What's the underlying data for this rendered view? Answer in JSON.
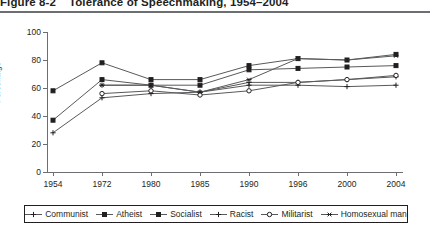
{
  "figure": {
    "number": "Figure 8-2",
    "caption": "Tolerance of Speechmaking, 1954–2004"
  },
  "chart_data": {
    "type": "line",
    "title": "Tolerance of Speechmaking, 1954–2004",
    "xlabel": "",
    "ylabel": "Percentage",
    "ylim": [
      0,
      100
    ],
    "ytick_labels": [
      "0",
      "20",
      "40",
      "60",
      "80",
      "100"
    ],
    "yticks": [
      0,
      20,
      40,
      60,
      80,
      100
    ],
    "grid": false,
    "legend_position": "bottom",
    "categories": [
      "1954",
      "1972",
      "1980",
      "1985",
      "1990",
      "1996",
      "2000",
      "2004"
    ],
    "x": [
      1954,
      1972,
      1980,
      1985,
      1990,
      1996,
      2000,
      2004
    ],
    "series": [
      {
        "name": "Communist",
        "marker": "cross",
        "values": [
          28,
          53,
          56,
          57,
          64,
          64,
          66,
          68
        ]
      },
      {
        "name": "Atheist",
        "marker": "square",
        "values": [
          37,
          66,
          62,
          62,
          73,
          74,
          75,
          76
        ]
      },
      {
        "name": "Socialist",
        "marker": "square",
        "values": [
          58,
          78,
          66,
          66,
          76,
          81,
          80,
          84
        ]
      },
      {
        "name": "Racist",
        "marker": "cross",
        "values": [
          null,
          62,
          62,
          57,
          62,
          62,
          61,
          62
        ]
      },
      {
        "name": "Militarist",
        "marker": "circle-open",
        "values": [
          null,
          56,
          58,
          55,
          58,
          64,
          66,
          69
        ]
      },
      {
        "name": "Homosexual man",
        "marker": "star",
        "values": [
          null,
          62,
          62,
          57,
          66,
          81,
          80,
          83
        ]
      }
    ]
  }
}
